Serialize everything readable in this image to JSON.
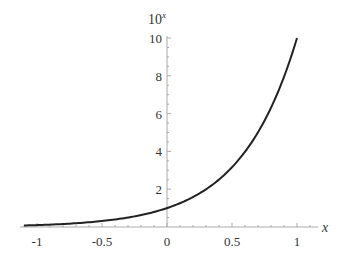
{
  "chart_data": {
    "type": "line",
    "title": "",
    "function": "10^x",
    "xlabel": "x",
    "ylabel": "10^x",
    "ylabel_base": "10",
    "ylabel_exp": "x",
    "xlim": [
      -1.1,
      1.0
    ],
    "ylim": [
      0,
      10
    ],
    "grid": false,
    "legend": null,
    "x_ticks": [
      -1,
      -0.5,
      0,
      0.5,
      1
    ],
    "x_tick_labels": [
      "-1",
      "-0.5",
      "0",
      "0.5",
      "1"
    ],
    "y_ticks": [
      2,
      4,
      6,
      8,
      10
    ],
    "y_tick_labels": [
      "2",
      "4",
      "6",
      "8",
      "10"
    ],
    "series": [
      {
        "name": "10^x",
        "color": "#222222",
        "x": [
          -1.1,
          -1.0,
          -0.9,
          -0.8,
          -0.7,
          -0.6,
          -0.5,
          -0.4,
          -0.3,
          -0.2,
          -0.1,
          0.0,
          0.1,
          0.2,
          0.3,
          0.4,
          0.5,
          0.6,
          0.7,
          0.8,
          0.9,
          1.0
        ],
        "y": [
          0.079,
          0.1,
          0.126,
          0.158,
          0.2,
          0.251,
          0.316,
          0.398,
          0.501,
          0.631,
          0.794,
          1.0,
          1.259,
          1.585,
          1.995,
          2.512,
          3.162,
          3.981,
          5.012,
          6.31,
          7.943,
          10.0
        ]
      }
    ]
  }
}
